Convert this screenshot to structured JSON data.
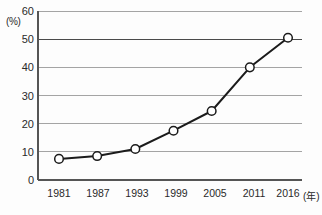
{
  "chart_data": {
    "type": "line",
    "title": "",
    "subtitle": "",
    "xlabel": "(年)",
    "ylabel": "(%)",
    "x": [
      "1981",
      "1987",
      "1993",
      "1999",
      "2005",
      "2011",
      "2016"
    ],
    "categories": [
      "1981",
      "1987",
      "1993",
      "1999",
      "2005",
      "2011",
      "2016"
    ],
    "values": [
      7.5,
      8.5,
      11,
      17.5,
      24.5,
      40,
      50.5
    ],
    "series": [
      {
        "name": "",
        "values": [
          7.5,
          8.5,
          11,
          17.5,
          24.5,
          40,
          50.5
        ]
      }
    ],
    "ylim": [
      0,
      60
    ],
    "y_ticks": [
      0,
      10,
      20,
      30,
      40,
      50,
      60
    ],
    "y_tick_labels": [
      "0",
      "10",
      "20",
      "30",
      "40",
      "50",
      "60"
    ],
    "x_tick_labels": [
      "1981",
      "1987",
      "1993",
      "1999",
      "2005",
      "2011",
      "2016"
    ],
    "grid": true,
    "grid_orientation": "horizontal",
    "legend": false,
    "legend_position": "none",
    "marker": "open-circle",
    "annotations": [],
    "emphasized_gridlines": [
      50
    ]
  },
  "axes": {
    "y_unit_label": "(%)",
    "x_unit_label": "(年)",
    "y_tick_0": "0",
    "y_tick_10": "10",
    "y_tick_20": "20",
    "y_tick_30": "30",
    "y_tick_40": "40",
    "y_tick_50": "50",
    "y_tick_60": "60",
    "x_tick_1981": "1981",
    "x_tick_1987": "1987",
    "x_tick_1993": "1993",
    "x_tick_1999": "1999",
    "x_tick_2005": "2005",
    "x_tick_2011": "2011",
    "x_tick_2016": "2016"
  },
  "colors": {
    "line": "#1b1b1b",
    "grid": "#9a9a9a",
    "grid_emphasis": "#4a4a4a",
    "axis": "#555555",
    "marker_fill": "#ffffff",
    "text": "#2a2a2a",
    "background": "#fdfdfd"
  }
}
